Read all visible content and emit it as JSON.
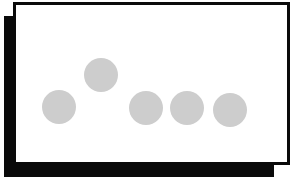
{
  "diagram": {
    "frame": {
      "border_color": "#0a0a0a",
      "fill_color": "#ffffff",
      "shadow_color": "#0a0a0a"
    },
    "dot_color": "#cdcdcd",
    "dots": [
      {
        "id": "dot-1",
        "cx": 59,
        "cy": 107,
        "r": 17
      },
      {
        "id": "dot-2",
        "cx": 101,
        "cy": 75,
        "r": 17
      },
      {
        "id": "dot-3",
        "cx": 146,
        "cy": 108,
        "r": 17
      },
      {
        "id": "dot-4",
        "cx": 187,
        "cy": 108,
        "r": 17
      },
      {
        "id": "dot-5",
        "cx": 230,
        "cy": 110,
        "r": 17
      }
    ]
  }
}
